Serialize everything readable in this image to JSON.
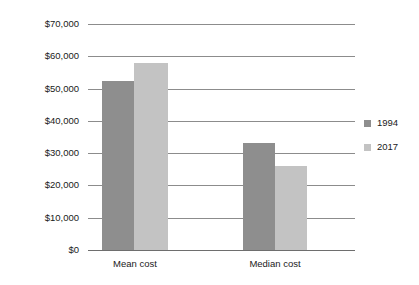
{
  "chart_data": {
    "type": "bar",
    "title": "",
    "subtitle": "",
    "xlabel": "",
    "ylabel": "",
    "categories": [
      "Mean cost",
      "Median cost"
    ],
    "series": [
      {
        "name": "1994",
        "color": "#8e8e8e",
        "values": [
          52500,
          33000
        ]
      },
      {
        "name": "2017",
        "color": "#c3c3c3",
        "values": [
          58000,
          26000
        ]
      }
    ],
    "ylim": [
      0,
      70000
    ],
    "ytick_values": [
      0,
      10000,
      20000,
      30000,
      40000,
      50000,
      60000,
      70000
    ],
    "ytick_labels": [
      "$0",
      "$10,000",
      "$20,000",
      "$30,000",
      "$40,000",
      "$50,000",
      "$60,000",
      "$70,000"
    ],
    "grid": true,
    "grid_axis": "y",
    "legend": true,
    "legend_position": "right",
    "annotations": []
  },
  "colors": {
    "background": "#ffffff",
    "gridline": "#8c8c8c",
    "axis": "#6e6e6e",
    "text": "#1a1a1a",
    "series_1994": "#8e8e8e",
    "series_2017": "#c3c3c3"
  }
}
